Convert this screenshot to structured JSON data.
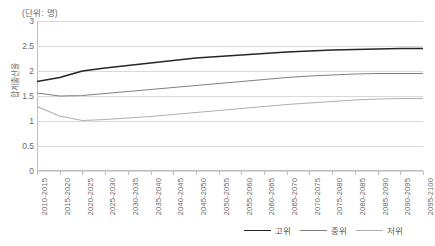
{
  "unit_label": "(단위: 명)",
  "y_axis_title": "합계출산율",
  "legend": {
    "items": [
      {
        "label": "고위",
        "color": "#262626"
      },
      {
        "label": "중위",
        "color": "#808080"
      },
      {
        "label": "저위",
        "color": "#b0b0b0"
      }
    ]
  },
  "chart_data": {
    "type": "line",
    "title": "",
    "subtitle": "",
    "xlabel": "",
    "ylabel": "합계출산율",
    "unit": "(단위: 명)",
    "ylim": [
      0,
      3
    ],
    "yticks": [
      0,
      0.5,
      1,
      1.5,
      2,
      2.5,
      3
    ],
    "ytick_labels": [
      "0",
      "0.5",
      "1",
      "1.5",
      "2",
      "2.5",
      "3"
    ],
    "grid": true,
    "legend_position": "bottom-right",
    "categories": [
      "2010-2015",
      "2015-2020",
      "2020-2025",
      "2025-2030",
      "2030-2035",
      "2035-2040",
      "2040-2045",
      "2045-2050",
      "2050-2055",
      "2055-2060",
      "2060-2065",
      "2065-2070",
      "2070-2075",
      "2075-2080",
      "2080-2085",
      "2085-2090",
      "2090-2095",
      "2095-2100"
    ],
    "series": [
      {
        "name": "고위",
        "color": "#262626",
        "values": [
          1.79,
          1.87,
          2.0,
          2.06,
          2.11,
          2.16,
          2.21,
          2.26,
          2.29,
          2.32,
          2.35,
          2.38,
          2.4,
          2.42,
          2.43,
          2.44,
          2.45,
          2.45
        ]
      },
      {
        "name": "중위",
        "color": "#808080",
        "values": [
          1.56,
          1.5,
          1.51,
          1.55,
          1.59,
          1.63,
          1.67,
          1.71,
          1.75,
          1.79,
          1.83,
          1.87,
          1.9,
          1.92,
          1.94,
          1.95,
          1.95,
          1.95
        ]
      },
      {
        "name": "저위",
        "color": "#b0b0b0",
        "values": [
          1.29,
          1.1,
          1.01,
          1.03,
          1.06,
          1.09,
          1.13,
          1.17,
          1.21,
          1.25,
          1.29,
          1.33,
          1.36,
          1.39,
          1.42,
          1.44,
          1.45,
          1.45
        ]
      }
    ]
  }
}
